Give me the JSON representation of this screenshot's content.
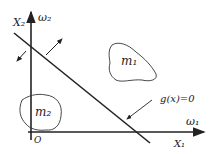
{
  "diagram": {
    "axes": {
      "y_label": "X₂",
      "y_class": "ω₂",
      "x_label": "X₁",
      "x_class": "ω₁",
      "origin": "O"
    },
    "regions": [
      {
        "label": "m₁"
      },
      {
        "label": "m₂"
      }
    ],
    "boundary_label": "g(x)=0",
    "colors": {
      "ink": "#222222",
      "background": "#ffffff"
    }
  }
}
